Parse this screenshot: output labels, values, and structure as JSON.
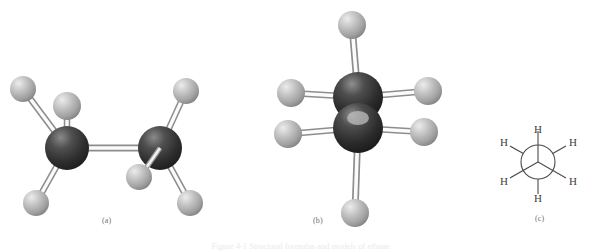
{
  "figure": {
    "title_caption": "Figure 4-1 Structural formulas and models of ethane",
    "background_color": "#ffffff",
    "panels": [
      {
        "id": "a",
        "label": "(a)",
        "label_x": 108,
        "label_y": 220,
        "type": "ball-and-stick-sawhorse"
      },
      {
        "id": "b",
        "label": "(b)",
        "label_x": 315,
        "label_y": 220,
        "type": "ball-and-stick-end-on"
      },
      {
        "id": "c",
        "label": "(c)",
        "label_x": 541,
        "label_y": 218,
        "type": "newman-projection"
      }
    ]
  },
  "colors": {
    "carbon_dark": "#2b2b2b",
    "carbon_mid": "#4d4d4d",
    "carbon_highlight": "#8d8d8d",
    "hydrogen_dark": "#8f8f8f",
    "hydrogen_mid": "#b4b4b4",
    "hydrogen_highlight": "#e2e2e2",
    "bond_stroke": "#8a8a8a",
    "bond_fill": "#fbfbfb",
    "line_color": "#4a4a4a",
    "label_color": "#6f6f6f",
    "caption_color": "#e9e9ef"
  },
  "panel_a": {
    "atoms": [
      {
        "name": "carbon-left",
        "element": "C",
        "x": 67,
        "y": 148,
        "r": 22
      },
      {
        "name": "carbon-right",
        "element": "C",
        "x": 160,
        "y": 148,
        "r": 22
      },
      {
        "name": "hydrogen-left-upper-left",
        "element": "H",
        "x": 23,
        "y": 89,
        "r": 13
      },
      {
        "name": "hydrogen-left-top",
        "element": "H",
        "x": 67,
        "y": 106,
        "r": 14
      },
      {
        "name": "hydrogen-left-lower-left",
        "element": "H",
        "x": 36,
        "y": 203,
        "r": 13
      },
      {
        "name": "hydrogen-right-upper-right",
        "element": "H",
        "x": 186,
        "y": 91,
        "r": 13
      },
      {
        "name": "hydrogen-right-front",
        "element": "H",
        "x": 139,
        "y": 177,
        "r": 13
      },
      {
        "name": "hydrogen-right-lower-right",
        "element": "H",
        "x": 190,
        "y": 203,
        "r": 13
      }
    ],
    "bonds": [
      {
        "name": "bond-c-c",
        "from": "carbon-left",
        "to": "carbon-right"
      },
      {
        "name": "bond-cl-h1",
        "from": "carbon-left",
        "to": "hydrogen-left-upper-left"
      },
      {
        "name": "bond-cl-h2",
        "from": "carbon-left",
        "to": "hydrogen-left-top"
      },
      {
        "name": "bond-cl-h3",
        "from": "carbon-left",
        "to": "hydrogen-left-lower-left"
      },
      {
        "name": "bond-cr-h1",
        "from": "carbon-right",
        "to": "hydrogen-right-upper-right"
      },
      {
        "name": "bond-cr-h2",
        "from": "carbon-right",
        "to": "hydrogen-right-front"
      },
      {
        "name": "bond-cr-h3",
        "from": "carbon-right",
        "to": "hydrogen-right-lower-right"
      }
    ]
  },
  "panel_b": {
    "atoms": [
      {
        "name": "carbon-back",
        "element": "C",
        "x": 358,
        "y": 97,
        "r": 25
      },
      {
        "name": "carbon-front",
        "element": "C",
        "x": 358,
        "y": 128,
        "r": 25
      },
      {
        "name": "hydrogen-top",
        "element": "H",
        "x": 352,
        "y": 25,
        "r": 14
      },
      {
        "name": "hydrogen-bottom",
        "element": "H",
        "x": 355,
        "y": 213,
        "r": 14
      },
      {
        "name": "hydrogen-upper-left",
        "element": "H",
        "x": 291,
        "y": 93,
        "r": 14
      },
      {
        "name": "hydrogen-lower-left",
        "element": "H",
        "x": 288,
        "y": 134,
        "r": 14
      },
      {
        "name": "hydrogen-upper-right",
        "element": "H",
        "x": 428,
        "y": 91,
        "r": 14
      },
      {
        "name": "hydrogen-lower-right",
        "element": "H",
        "x": 424,
        "y": 132,
        "r": 14
      }
    ],
    "bonds": [
      {
        "name": "bond-top",
        "from": "carbon-back",
        "to": "hydrogen-top"
      },
      {
        "name": "bond-bottom",
        "from": "carbon-front",
        "to": "hydrogen-bottom"
      },
      {
        "name": "bond-upper-left",
        "from": "carbon-back",
        "to": "hydrogen-upper-left"
      },
      {
        "name": "bond-lower-left",
        "from": "carbon-front",
        "to": "hydrogen-lower-left"
      },
      {
        "name": "bond-upper-right",
        "from": "carbon-back",
        "to": "hydrogen-upper-right"
      },
      {
        "name": "bond-lower-right",
        "from": "carbon-front",
        "to": "hydrogen-lower-right"
      }
    ]
  },
  "panel_c": {
    "center_x": 538,
    "center_y": 162,
    "circle_radius": 17,
    "front_bond_labels": [
      "H",
      "H",
      "H"
    ],
    "back_bond_labels": [
      "H",
      "H",
      "H"
    ],
    "hydrogen_labels": [
      {
        "name": "h-top",
        "text": "H",
        "x": 538,
        "y": 131
      },
      {
        "name": "h-upper-left",
        "text": "H",
        "x": 506,
        "y": 144
      },
      {
        "name": "h-upper-right",
        "text": "H",
        "x": 570,
        "y": 144
      },
      {
        "name": "h-lower-left",
        "text": "H",
        "x": 506,
        "y": 186
      },
      {
        "name": "h-lower-right",
        "text": "H",
        "x": 570,
        "y": 186
      },
      {
        "name": "h-bottom",
        "text": "H",
        "x": 538,
        "y": 199
      }
    ]
  }
}
